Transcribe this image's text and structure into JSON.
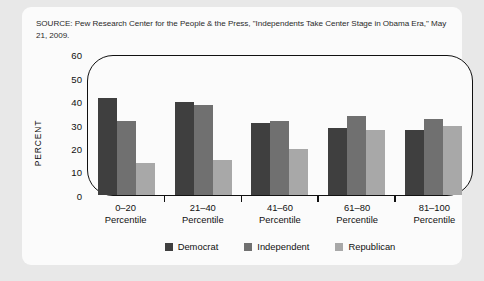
{
  "source_note": "SOURCE: Pew Research Center for the People & the Press, \"Independents Take Center Stage in Obama Era,\" May 21, 2009.",
  "colors": {
    "page_background": "#e8e8e8",
    "card_background": "#fbfbfb",
    "axis": "#111111",
    "democrat": "#3f3f3f",
    "independent": "#707070",
    "republican": "#a8a8a8"
  },
  "chart_data": {
    "type": "bar",
    "title": "",
    "xlabel": "",
    "ylabel": "PERCENT",
    "categories": [
      "0–20\nPercentile",
      "21–40\nPercentile",
      "41–60\nPercentile",
      "61–80\nPercentile",
      "81–100\nPercentile"
    ],
    "category_lines": [
      [
        "0–20",
        "Percentile"
      ],
      [
        "21–40",
        "Percentile"
      ],
      [
        "41–60",
        "Percentile"
      ],
      [
        "61–80",
        "Percentile"
      ],
      [
        "81–100",
        "Percentile"
      ]
    ],
    "series": [
      {
        "name": "Democrat",
        "color": "#3f3f3f",
        "values": [
          42,
          40,
          31,
          29,
          28
        ]
      },
      {
        "name": "Independent",
        "color": "#707070",
        "values": [
          32,
          39,
          32,
          34,
          33
        ]
      },
      {
        "name": "Republican",
        "color": "#a8a8a8",
        "values": [
          14,
          15,
          20,
          28,
          30
        ]
      }
    ],
    "ylim": [
      0,
      60
    ],
    "yticks": [
      60,
      50,
      40,
      30,
      20,
      10,
      0
    ],
    "grid": false,
    "legend_position": "bottom"
  }
}
